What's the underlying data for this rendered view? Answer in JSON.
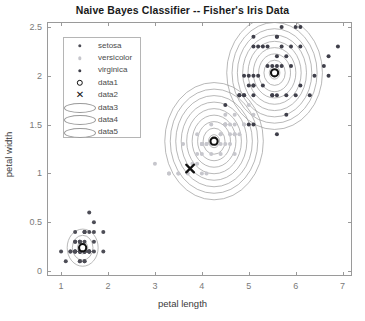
{
  "figure": {
    "width": 365,
    "height": 321,
    "background": "#ffffff"
  },
  "chart_data": {
    "type": "scatter",
    "title": "Naive Bayes Classifier -- Fisher's Iris Data",
    "xlabel": "petal length",
    "ylabel": "petal width",
    "xlim": [
      0.7,
      7.2
    ],
    "ylim": [
      -0.05,
      2.55
    ],
    "xticks": [
      1,
      2,
      3,
      4,
      5,
      6,
      7
    ],
    "xticklabels": [
      "1",
      "2",
      "3",
      "4",
      "5",
      "6",
      "7"
    ],
    "yticks": [
      0,
      0.5,
      1,
      1.5,
      2,
      2.5
    ],
    "yticklabels": [
      "0",
      "0.5",
      "1",
      "1.5",
      "2",
      "2.5"
    ],
    "grid": false,
    "legend_position": "north-west",
    "colors": {
      "setosa": "#4d4d56",
      "versicolor": "#c6c6cc",
      "virginica": "#3f3f4a",
      "marker_data1": "#111111",
      "marker_data2": "#111111",
      "contour": "#9a9a9a",
      "axis": "#9a9a9a",
      "tick_text": "#7a7a7a",
      "label_text": "#3a3a3a",
      "title_text": "#1a1a1a"
    },
    "series": [
      {
        "name": "setosa",
        "marker": "dot",
        "color": "#4d4d56",
        "points": [
          [
            1.4,
            0.2
          ],
          [
            1.4,
            0.2
          ],
          [
            1.3,
            0.2
          ],
          [
            1.5,
            0.2
          ],
          [
            1.4,
            0.2
          ],
          [
            1.7,
            0.4
          ],
          [
            1.4,
            0.3
          ],
          [
            1.5,
            0.2
          ],
          [
            1.4,
            0.2
          ],
          [
            1.5,
            0.1
          ],
          [
            1.5,
            0.2
          ],
          [
            1.6,
            0.2
          ],
          [
            1.4,
            0.1
          ],
          [
            1.1,
            0.1
          ],
          [
            1.2,
            0.2
          ],
          [
            1.5,
            0.4
          ],
          [
            1.3,
            0.4
          ],
          [
            1.4,
            0.3
          ],
          [
            1.7,
            0.3
          ],
          [
            1.5,
            0.3
          ],
          [
            1.7,
            0.2
          ],
          [
            1.5,
            0.4
          ],
          [
            1.0,
            0.2
          ],
          [
            1.7,
            0.5
          ],
          [
            1.9,
            0.2
          ],
          [
            1.6,
            0.2
          ],
          [
            1.6,
            0.4
          ],
          [
            1.5,
            0.2
          ],
          [
            1.4,
            0.2
          ],
          [
            1.6,
            0.2
          ],
          [
            1.6,
            0.2
          ],
          [
            1.5,
            0.4
          ],
          [
            1.5,
            0.1
          ],
          [
            1.4,
            0.2
          ],
          [
            1.5,
            0.2
          ],
          [
            1.2,
            0.2
          ],
          [
            1.3,
            0.2
          ],
          [
            1.4,
            0.1
          ],
          [
            1.3,
            0.2
          ],
          [
            1.5,
            0.2
          ],
          [
            1.3,
            0.3
          ],
          [
            1.3,
            0.3
          ],
          [
            1.3,
            0.2
          ],
          [
            1.6,
            0.6
          ],
          [
            1.9,
            0.4
          ],
          [
            1.4,
            0.3
          ],
          [
            1.6,
            0.2
          ],
          [
            1.4,
            0.2
          ],
          [
            1.5,
            0.2
          ],
          [
            1.4,
            0.2
          ]
        ]
      },
      {
        "name": "versicolor",
        "marker": "dot",
        "color": "#c6c6cc",
        "points": [
          [
            4.7,
            1.4
          ],
          [
            4.5,
            1.5
          ],
          [
            4.9,
            1.5
          ],
          [
            4.0,
            1.3
          ],
          [
            4.6,
            1.5
          ],
          [
            4.5,
            1.3
          ],
          [
            4.7,
            1.6
          ],
          [
            3.3,
            1.0
          ],
          [
            4.6,
            1.3
          ],
          [
            3.9,
            1.4
          ],
          [
            3.5,
            1.0
          ],
          [
            4.2,
            1.5
          ],
          [
            4.0,
            1.0
          ],
          [
            4.7,
            1.4
          ],
          [
            3.6,
            1.3
          ],
          [
            4.4,
            1.4
          ],
          [
            4.5,
            1.5
          ],
          [
            4.1,
            1.0
          ],
          [
            4.5,
            1.5
          ],
          [
            3.9,
            1.1
          ],
          [
            4.8,
            1.8
          ],
          [
            4.0,
            1.3
          ],
          [
            4.9,
            1.5
          ],
          [
            4.7,
            1.2
          ],
          [
            4.3,
            1.3
          ],
          [
            4.4,
            1.4
          ],
          [
            4.8,
            1.4
          ],
          [
            5.0,
            1.7
          ],
          [
            4.5,
            1.5
          ],
          [
            3.5,
            1.0
          ],
          [
            3.8,
            1.1
          ],
          [
            3.7,
            1.0
          ],
          [
            3.9,
            1.2
          ],
          [
            5.1,
            1.6
          ],
          [
            4.5,
            1.5
          ],
          [
            4.5,
            1.6
          ],
          [
            4.7,
            1.5
          ],
          [
            4.4,
            1.3
          ],
          [
            4.1,
            1.3
          ],
          [
            4.0,
            1.3
          ],
          [
            4.4,
            1.2
          ],
          [
            4.6,
            1.4
          ],
          [
            4.0,
            1.2
          ],
          [
            3.3,
            1.0
          ],
          [
            4.2,
            1.3
          ],
          [
            4.2,
            1.2
          ],
          [
            4.2,
            1.3
          ],
          [
            4.3,
            1.3
          ],
          [
            3.0,
            1.1
          ],
          [
            4.1,
            1.3
          ]
        ]
      },
      {
        "name": "virginica",
        "marker": "dot",
        "color": "#3f3f4a",
        "points": [
          [
            6.0,
            2.5
          ],
          [
            5.1,
            1.9
          ],
          [
            5.9,
            2.1
          ],
          [
            5.6,
            1.8
          ],
          [
            5.8,
            2.2
          ],
          [
            6.6,
            2.1
          ],
          [
            4.5,
            1.7
          ],
          [
            6.3,
            1.8
          ],
          [
            5.8,
            1.8
          ],
          [
            6.1,
            2.5
          ],
          [
            5.1,
            2.0
          ],
          [
            5.3,
            1.9
          ],
          [
            5.5,
            2.1
          ],
          [
            5.0,
            2.0
          ],
          [
            5.1,
            2.4
          ],
          [
            5.3,
            2.3
          ],
          [
            5.5,
            1.8
          ],
          [
            6.7,
            2.2
          ],
          [
            6.9,
            2.3
          ],
          [
            5.0,
            1.5
          ],
          [
            5.7,
            2.3
          ],
          [
            4.9,
            2.0
          ],
          [
            6.7,
            2.0
          ],
          [
            4.9,
            1.8
          ],
          [
            5.7,
            2.1
          ],
          [
            6.0,
            1.8
          ],
          [
            4.8,
            1.8
          ],
          [
            4.9,
            1.8
          ],
          [
            5.6,
            2.1
          ],
          [
            5.8,
            1.6
          ],
          [
            6.1,
            1.9
          ],
          [
            6.4,
            2.0
          ],
          [
            5.6,
            2.2
          ],
          [
            5.1,
            1.5
          ],
          [
            5.6,
            1.4
          ],
          [
            6.1,
            2.3
          ],
          [
            5.6,
            2.4
          ],
          [
            5.5,
            1.8
          ],
          [
            4.8,
            1.8
          ],
          [
            5.4,
            2.1
          ],
          [
            5.6,
            2.4
          ],
          [
            5.1,
            2.3
          ],
          [
            5.1,
            1.9
          ],
          [
            5.9,
            2.3
          ],
          [
            5.7,
            2.5
          ],
          [
            5.2,
            2.3
          ],
          [
            5.0,
            1.9
          ],
          [
            5.2,
            2.0
          ],
          [
            5.4,
            2.3
          ],
          [
            5.1,
            1.8
          ]
        ]
      }
    ],
    "markers": [
      {
        "name": "data1",
        "symbol": "o",
        "label": "data1",
        "points": [
          [
            1.46,
            0.24
          ],
          [
            4.26,
            1.33
          ],
          [
            5.55,
            2.03
          ]
        ]
      },
      {
        "name": "data2",
        "symbol": "x",
        "label": "data2",
        "points": [
          [
            3.75,
            1.05
          ]
        ]
      }
    ],
    "contours": [
      {
        "name": "data3",
        "center": [
          1.46,
          0.24
        ],
        "rx": 0.33,
        "ry": 0.19,
        "levels": 3
      },
      {
        "name": "data4",
        "center": [
          4.26,
          1.33
        ],
        "rx": 1.05,
        "ry": 0.6,
        "levels": 9
      },
      {
        "name": "data5",
        "center": [
          5.55,
          2.03
        ],
        "rx": 1.02,
        "ry": 0.58,
        "levels": 9
      }
    ]
  },
  "legend": {
    "items": [
      {
        "label": "setosa",
        "marker": "dot",
        "color": "#4d4d56"
      },
      {
        "label": "versicolor",
        "marker": "dot",
        "color": "#c6c6cc"
      },
      {
        "label": "virginica",
        "marker": "dot",
        "color": "#3f3f4a"
      },
      {
        "label": "data1",
        "marker": "circle-open",
        "color": "#111111"
      },
      {
        "label": "data2",
        "marker": "cross",
        "color": "#111111",
        "glyph": "✕"
      },
      {
        "label": "data3",
        "marker": "ellipse",
        "color": "#9a9a9a"
      },
      {
        "label": "data4",
        "marker": "ellipse",
        "color": "#9a9a9a"
      },
      {
        "label": "data5",
        "marker": "ellipse",
        "color": "#9a9a9a"
      }
    ]
  }
}
